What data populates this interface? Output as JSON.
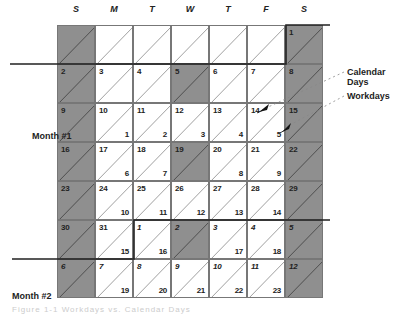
{
  "day_headers": [
    "S",
    "M",
    "T",
    "W",
    "T",
    "F",
    "S"
  ],
  "month_labels": {
    "month1": "Month #1",
    "month2": "Month #2"
  },
  "legend": {
    "calendar_days": "Calendar Days",
    "workdays": "Workdays"
  },
  "colors": {
    "weekend_shade": "#8f8f8f",
    "line": "#777777",
    "boundary": "#222222"
  },
  "rows": [
    [
      {
        "cal": "",
        "wd": "",
        "shaded": true
      },
      {
        "cal": "",
        "wd": "",
        "shaded": false
      },
      {
        "cal": "",
        "wd": "",
        "shaded": false
      },
      {
        "cal": "",
        "wd": "",
        "shaded": false
      },
      {
        "cal": "",
        "wd": "",
        "shaded": false
      },
      {
        "cal": "",
        "wd": "",
        "shaded": false
      },
      {
        "cal": "1",
        "wd": "",
        "shaded": true
      }
    ],
    [
      {
        "cal": "2",
        "wd": "",
        "shaded": true
      },
      {
        "cal": "3",
        "wd": "",
        "shaded": false
      },
      {
        "cal": "4",
        "wd": "",
        "shaded": false
      },
      {
        "cal": "5",
        "wd": "",
        "shaded": true
      },
      {
        "cal": "6",
        "wd": "",
        "shaded": false
      },
      {
        "cal": "7",
        "wd": "",
        "shaded": false
      },
      {
        "cal": "8",
        "wd": "",
        "shaded": true
      }
    ],
    [
      {
        "cal": "9",
        "wd": "",
        "shaded": true
      },
      {
        "cal": "10",
        "wd": "1",
        "shaded": false
      },
      {
        "cal": "11",
        "wd": "2",
        "shaded": false
      },
      {
        "cal": "12",
        "wd": "3",
        "shaded": false
      },
      {
        "cal": "13",
        "wd": "4",
        "shaded": false
      },
      {
        "cal": "14",
        "wd": "5",
        "shaded": false
      },
      {
        "cal": "15",
        "wd": "",
        "shaded": true
      }
    ],
    [
      {
        "cal": "16",
        "wd": "",
        "shaded": true
      },
      {
        "cal": "17",
        "wd": "6",
        "shaded": false
      },
      {
        "cal": "18",
        "wd": "7",
        "shaded": false
      },
      {
        "cal": "19",
        "wd": "",
        "shaded": true
      },
      {
        "cal": "20",
        "wd": "8",
        "shaded": false
      },
      {
        "cal": "21",
        "wd": "9",
        "shaded": false
      },
      {
        "cal": "22",
        "wd": "",
        "shaded": true
      }
    ],
    [
      {
        "cal": "23",
        "wd": "",
        "shaded": true
      },
      {
        "cal": "24",
        "wd": "10",
        "shaded": false
      },
      {
        "cal": "25",
        "wd": "11",
        "shaded": false
      },
      {
        "cal": "26",
        "wd": "12",
        "shaded": false
      },
      {
        "cal": "27",
        "wd": "13",
        "shaded": false
      },
      {
        "cal": "28",
        "wd": "14",
        "shaded": false
      },
      {
        "cal": "29",
        "wd": "",
        "shaded": true
      }
    ],
    [
      {
        "cal": "30",
        "wd": "",
        "shaded": true
      },
      {
        "cal": "31",
        "wd": "15",
        "shaded": false
      },
      {
        "cal": "1",
        "wd": "16",
        "shaded": false,
        "next": true
      },
      {
        "cal": "2",
        "wd": "",
        "shaded": true,
        "next": true
      },
      {
        "cal": "3",
        "wd": "17",
        "shaded": false,
        "next": true
      },
      {
        "cal": "4",
        "wd": "18",
        "shaded": false,
        "next": true
      },
      {
        "cal": "5",
        "wd": "",
        "shaded": true,
        "next": true
      }
    ],
    [
      {
        "cal": "6",
        "wd": "",
        "shaded": true,
        "next": true
      },
      {
        "cal": "7",
        "wd": "19",
        "shaded": false,
        "next": true
      },
      {
        "cal": "8",
        "wd": "20",
        "shaded": false,
        "next": true
      },
      {
        "cal": "9",
        "wd": "21",
        "shaded": false,
        "next": true
      },
      {
        "cal": "10",
        "wd": "22",
        "shaded": false,
        "next": true
      },
      {
        "cal": "11",
        "wd": "23",
        "shaded": false,
        "next": true
      },
      {
        "cal": "12",
        "wd": "",
        "shaded": true,
        "next": true
      }
    ]
  ],
  "caption": "Figure 1-1   Workdays vs. Calendar Days"
}
